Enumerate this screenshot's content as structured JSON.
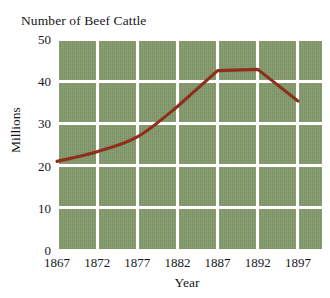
{
  "chart_data": {
    "type": "line",
    "title": "Number of Beef Cattle",
    "xlabel": "Year",
    "ylabel": "Millions",
    "x": [
      1867,
      1872,
      1877,
      1882,
      1887,
      1892,
      1897
    ],
    "values": [
      21.0,
      23.3,
      26.8,
      34.0,
      42.5,
      42.8,
      35.3
    ],
    "series": [
      {
        "name": "Beef cattle",
        "values": [
          21.0,
          23.3,
          26.8,
          34.0,
          42.5,
          42.8,
          35.3
        ],
        "color": "#8f2e1a"
      }
    ],
    "xlim": [
      1867,
      1900
    ],
    "ylim": [
      0,
      50
    ],
    "xticks": [
      "1867",
      "1872",
      "1877",
      "1882",
      "1887",
      "1892",
      "1897"
    ],
    "yticks": [
      "0",
      "10",
      "20",
      "30",
      "40",
      "50"
    ],
    "grid": true,
    "legend": "none",
    "plot_background_color": "#82996a",
    "gridline_color": "#ffffff",
    "line_color": "#8f2e1a"
  },
  "figure": {
    "title": "Number of Beef Cattle",
    "x_axis_title": "Year",
    "y_axis_title": "Millions",
    "y_tick_labels": [
      "50",
      "40",
      "30",
      "20",
      "10",
      "0"
    ],
    "x_tick_labels": [
      "1867",
      "1872",
      "1877",
      "1882",
      "1887",
      "1892",
      "1897"
    ],
    "caption_fragment": ""
  }
}
